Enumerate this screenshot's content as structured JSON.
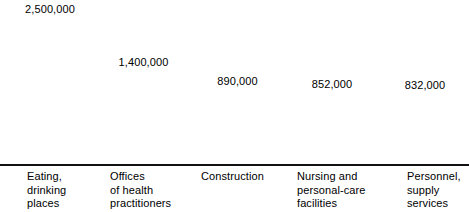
{
  "chart_data": {
    "type": "bar",
    "title": "",
    "subtitle": "",
    "xlabel": "",
    "ylabel": "",
    "grid": false,
    "legend": "none",
    "ylim": [
      0,
      2500000
    ],
    "categories": [
      "Eating,\ndrinking\nplaces",
      "Offices\nof health\npractitioners",
      "Construction",
      "Nursing and\npersonal-care\nfacilities",
      "Personnel,\nsupply\nservices"
    ],
    "values": [
      2500000,
      1400000,
      890000,
      852000,
      832000
    ],
    "value_labels": [
      "2,500,000",
      "1,400,000",
      "890,000",
      "852,000",
      "832,000"
    ],
    "bar_colors": [
      "#555555",
      "#4d4d4d",
      "#424242",
      "#2e2e2e",
      "#1e1e1e"
    ],
    "bar_outline_color": "#141414",
    "bar_shadow_color": "#d8d8d8",
    "baseline_color": "#111111",
    "bars": [
      {
        "category": "Eating,\ndrinking\nplaces",
        "value": 2500000,
        "value_label": "2,500,000",
        "color": "#555555",
        "left": 7,
        "width": 86,
        "height": 147,
        "label_left": 27
      },
      {
        "category": "Offices\nof health\npractitioners",
        "value": 1400000,
        "value_label": "1,400,000",
        "color": "#4d4d4d",
        "left": 104,
        "width": 79,
        "height": 94,
        "label_left": 110
      },
      {
        "category": "Construction",
        "value": 890000,
        "value_label": "890,000",
        "color": "#424242",
        "left": 196,
        "width": 83,
        "height": 75,
        "label_left": 201
      },
      {
        "category": "Nursing and\npersonal-care\nfacilities",
        "value": 852000,
        "value_label": "852,000",
        "color": "#2e2e2e",
        "left": 292,
        "width": 80,
        "height": 72,
        "label_left": 297
      },
      {
        "category": "Personnel,\nsupply\nservices",
        "value": 832000,
        "value_label": "832,000",
        "color": "#1e1e1e",
        "left": 385,
        "width": 80,
        "height": 71,
        "label_left": 407
      }
    ]
  }
}
